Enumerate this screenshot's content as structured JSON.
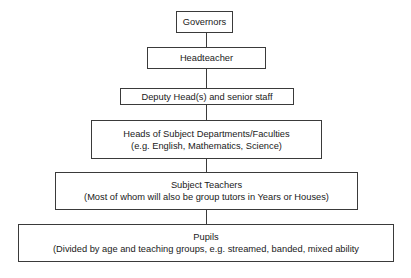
{
  "diagram": {
    "type": "org-hierarchy",
    "nodes": [
      {
        "id": "governors",
        "lines": [
          "Governors"
        ]
      },
      {
        "id": "headteacher",
        "lines": [
          "Headteacher"
        ]
      },
      {
        "id": "deputy",
        "lines": [
          "Deputy Head(s) and senior staff"
        ]
      },
      {
        "id": "heads-of-departments",
        "lines": [
          "Heads of Subject Departments/Faculties",
          "(e.g. English, Mathematics, Science)"
        ]
      },
      {
        "id": "subject-teachers",
        "lines": [
          "Subject Teachers",
          "(Most of whom will also be group tutors in Years or Houses)"
        ]
      },
      {
        "id": "pupils",
        "lines": [
          "Pupils",
          "(Divided by age and teaching groups, e.g. streamed, banded, mixed ability"
        ]
      }
    ],
    "edges": [
      [
        "governors",
        "headteacher"
      ],
      [
        "headteacher",
        "deputy"
      ],
      [
        "deputy",
        "heads-of-departments"
      ],
      [
        "heads-of-departments",
        "subject-teachers"
      ],
      [
        "subject-teachers",
        "pupils"
      ]
    ]
  }
}
